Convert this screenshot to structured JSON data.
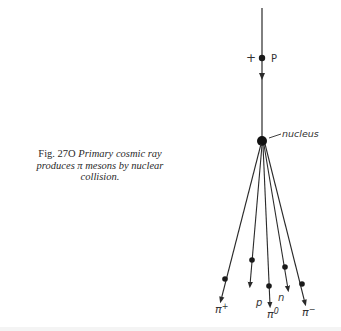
{
  "caption": {
    "figure_label": "Fig. 27O",
    "text": "Primary cosmic ray produces π mesons by nuclear collision."
  },
  "diagram": {
    "incoming_particle": {
      "charge_sign": "+",
      "label": "P"
    },
    "nucleus_label": "nucleus",
    "outgoing_tracks": [
      {
        "label": "π+",
        "symbol": "π",
        "sup": "+"
      },
      {
        "label": "p",
        "symbol": "p",
        "sup": ""
      },
      {
        "label": "π0",
        "symbol": "π",
        "sup": "0"
      },
      {
        "label": "n",
        "symbol": "n",
        "sup": ""
      },
      {
        "label": "π−",
        "symbol": "π",
        "sup": "−"
      }
    ],
    "colors": {
      "ink": "#2a2a2a"
    }
  }
}
